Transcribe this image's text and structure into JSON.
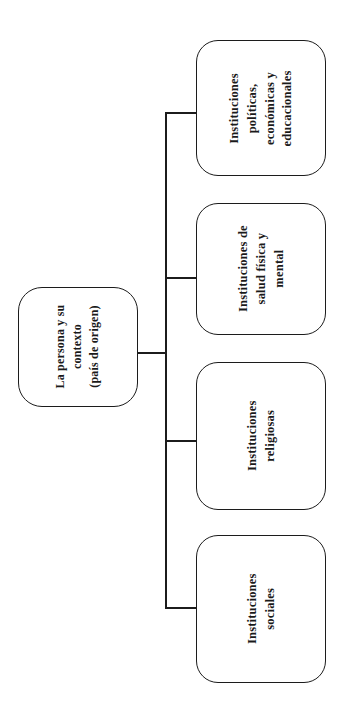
{
  "diagram": {
    "type": "tree",
    "orientation": "rotated-90-counterclockwise",
    "language": "es",
    "line_color": "#1c1c1c",
    "text_color": "#1a1a1a",
    "background_color": "#ffffff",
    "root": {
      "label": "La persona y su\ncontexto\n(país de origen)"
    },
    "children": [
      {
        "label": "Instituciones\npolíticas,\neconómicas y\neducacionales"
      },
      {
        "label": "Instituciones de\nsalud física y\nmental"
      },
      {
        "label": "Instituciones\nreligiosas"
      },
      {
        "label": "Instituciones\nsociales"
      }
    ]
  }
}
